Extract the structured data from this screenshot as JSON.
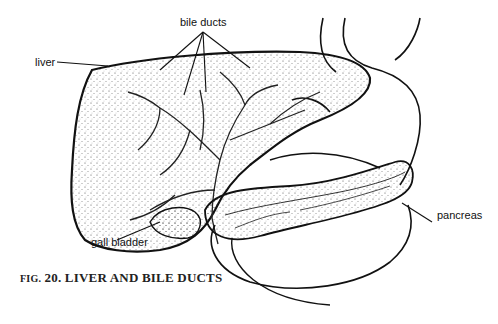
{
  "figure": {
    "caption_prefix": "FIG.",
    "caption_number": "20.",
    "caption_title": "LIVER AND BILE DUCTS"
  },
  "labels": {
    "bile_ducts": "bile ducts",
    "liver": "liver",
    "gall_bladder": "gall bladder",
    "pancreas": "pancreas"
  },
  "colors": {
    "line": "#111111",
    "background": "#ffffff"
  }
}
